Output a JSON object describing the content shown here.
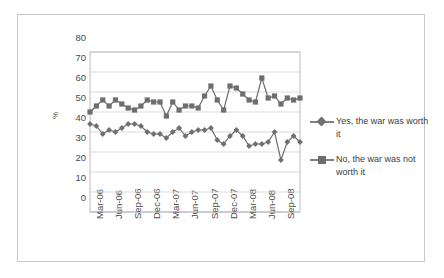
{
  "chart_data": {
    "type": "line",
    "title": "",
    "subtitle": "",
    "xlabel": "",
    "ylabel": "%",
    "ylim": [
      0,
      80
    ],
    "ytick_step": 10,
    "yticks": [
      "80",
      "70",
      "60",
      "50",
      "40",
      "30",
      "20",
      "10",
      "0"
    ],
    "grid": true,
    "grid_axis": "y",
    "legend_position": "right",
    "x_tick_labels": [
      "Mar-06",
      "Jun-06",
      "Sep-06",
      "Dec-06",
      "Mar-07",
      "Jun-07",
      "Sep-07",
      "Dec-07",
      "Mar-08",
      "Jun-08",
      "Sep-08"
    ],
    "x_tick_interval_months": 3,
    "x": [
      "Mar-06",
      "Apr-06",
      "May-06",
      "Jun-06",
      "Jul-06",
      "Aug-06",
      "Sep-06",
      "Oct-06",
      "Nov-06",
      "Dec-06",
      "Jan-07",
      "Feb-07",
      "Mar-07",
      "Apr-07",
      "May-07",
      "Jun-07",
      "Jul-07",
      "Aug-07",
      "Sep-07",
      "Oct-07",
      "Nov-07",
      "Dec-07",
      "Jan-08",
      "Feb-08",
      "Mar-08",
      "Apr-08",
      "May-08",
      "Jun-08",
      "Jul-08",
      "Aug-08",
      "Sep-08",
      "Oct-08",
      "Nov-08",
      "Dec-08"
    ],
    "series": [
      {
        "name": "Yes, the war was worth it",
        "marker": "diamond",
        "color": "#6f6f6f",
        "values": [
          44,
          43,
          39,
          41,
          40,
          42,
          44,
          44,
          43,
          40,
          39,
          39,
          37,
          40,
          42,
          38,
          40,
          41,
          41,
          42,
          36,
          34,
          38,
          41,
          38,
          33,
          34,
          34,
          35,
          40,
          26,
          35,
          38,
          35
        ]
      },
      {
        "name": "No, the war was not worth it",
        "marker": "square",
        "color": "#6e6e6e",
        "values": [
          50,
          53,
          56,
          53,
          56,
          54,
          52,
          51,
          53,
          56,
          55,
          55,
          48,
          55,
          51,
          53,
          53,
          52,
          58,
          63,
          56,
          51,
          63,
          62,
          59,
          56,
          55,
          67,
          57,
          58,
          54,
          57,
          56,
          57
        ]
      }
    ]
  },
  "legend": {
    "items": [
      {
        "label": "Yes, the war was worth it"
      },
      {
        "label": "No, the war was not worth it"
      }
    ]
  }
}
